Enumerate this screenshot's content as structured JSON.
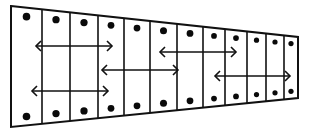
{
  "diagram": {
    "title": "",
    "colors": {
      "stroke": "#111111",
      "fill": "#ffffff",
      "dot": "#0a0a0a"
    },
    "column_count": 12,
    "dots_per_column": [
      "top",
      "bottom"
    ],
    "arrows": [
      {
        "id": "arrow-1",
        "type": "double-headed",
        "from_column": 1,
        "to_column": 4
      },
      {
        "id": "arrow-2",
        "type": "double-headed",
        "from_column": 4,
        "to_column": 6
      },
      {
        "id": "arrow-3",
        "type": "double-headed",
        "from_column": 6,
        "to_column": 9
      },
      {
        "id": "arrow-4",
        "type": "double-headed",
        "from_column": 1,
        "to_column": 4
      },
      {
        "id": "arrow-5",
        "type": "double-headed",
        "from_column": 8,
        "to_column": 12
      }
    ]
  }
}
